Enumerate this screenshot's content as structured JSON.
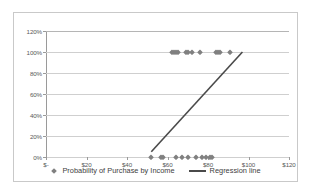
{
  "chart_data": {
    "type": "scatter",
    "title": "",
    "xlabel": "",
    "ylabel": "",
    "xlim": [
      0,
      120
    ],
    "ylim": [
      0,
      120
    ],
    "x_tick_labels": [
      "$-",
      "$20",
      "$40",
      "$60",
      "$80",
      "$100",
      "$120"
    ],
    "x_tick_values": [
      0,
      20,
      40,
      60,
      80,
      100,
      120
    ],
    "y_tick_labels": [
      "0%",
      "20%",
      "40%",
      "60%",
      "80%",
      "100%",
      "120%"
    ],
    "y_tick_values": [
      0,
      20,
      40,
      60,
      80,
      100,
      120
    ],
    "grid": "horizontal",
    "legend_position": "bottom",
    "series": [
      {
        "name": "Probability of Purchase by Income",
        "type": "scatter",
        "marker": "diamond",
        "color": "#808080",
        "points": [
          [
            52,
            0
          ],
          [
            57,
            0
          ],
          [
            58,
            0
          ],
          [
            64,
            0
          ],
          [
            67,
            0
          ],
          [
            70,
            0
          ],
          [
            74,
            0
          ],
          [
            77,
            0
          ],
          [
            79,
            0
          ],
          [
            81,
            0
          ],
          [
            82,
            0
          ],
          [
            62,
            100
          ],
          [
            63,
            100
          ],
          [
            64,
            100
          ],
          [
            65,
            100
          ],
          [
            69,
            100
          ],
          [
            70,
            100
          ],
          [
            72,
            100
          ],
          [
            76,
            100
          ],
          [
            84,
            100
          ],
          [
            85,
            100
          ],
          [
            86,
            100
          ],
          [
            91,
            100
          ]
        ]
      },
      {
        "name": "Regression line",
        "type": "line",
        "color": "#4a4a4a",
        "points": [
          [
            52,
            5
          ],
          [
            97,
            100
          ]
        ]
      }
    ]
  },
  "legend": {
    "entries": [
      {
        "label": "Probability of Purchase by Income",
        "marker": "diamond"
      },
      {
        "label": "Regression line",
        "marker": "line"
      }
    ]
  },
  "colors": {
    "marker": "#808080",
    "regression_line": "#4a4a4a",
    "gridline": "#cfcfcf",
    "axis": "#9a9a9a",
    "border": "#c9c9c9",
    "tick_text": "#595959",
    "legend_text": "#404040"
  }
}
